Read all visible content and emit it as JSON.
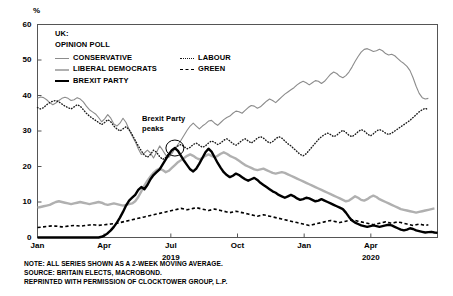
{
  "chart_data": {
    "type": "line",
    "title": "UK: OPINION POLL",
    "title_lines": [
      "UK:",
      "OPINION POLL"
    ],
    "xlabel": "",
    "ylabel": "%",
    "ylim": [
      0,
      60
    ],
    "yticks": [
      0,
      10,
      20,
      30,
      40,
      50,
      60
    ],
    "grid": false,
    "legend_position": "top-left-inside",
    "xticks": [
      {
        "label": "Jan",
        "year": ""
      },
      {
        "label": "Apr",
        "year": ""
      },
      {
        "label": "Jul",
        "year": "2019"
      },
      {
        "label": "Oct",
        "year": ""
      },
      {
        "label": "Jan",
        "year": ""
      },
      {
        "label": "Apr",
        "year": "2020"
      }
    ],
    "x_range": [
      "2019-01",
      "2020-06"
    ],
    "annotations": [
      {
        "text_lines": [
          "Brexit Party",
          "peaks"
        ],
        "x": "2019-05-26",
        "y": 25,
        "marker": "circle"
      }
    ],
    "series": [
      {
        "name": "CONSERVATIVE",
        "color": "#8c8c8c",
        "style": "solid",
        "width": 1.1,
        "values": [
          39.2,
          39.6,
          39.4,
          38.8,
          38.0,
          37.4,
          37.9,
          38.6,
          39.2,
          39.5,
          39.2,
          38.6,
          38.8,
          39.4,
          39.0,
          38.2,
          37.0,
          36.0,
          35.4,
          34.8,
          33.8,
          32.6,
          33.4,
          34.6,
          33.6,
          32.0,
          31.4,
          32.2,
          33.6,
          32.4,
          30.4,
          28.6,
          27.0,
          25.0,
          23.4,
          23.8,
          24.6,
          23.8,
          22.4,
          24.0,
          25.8,
          24.6,
          23.2,
          22.6,
          23.6,
          25.0,
          26.2,
          27.4,
          28.8,
          30.2,
          31.4,
          32.2,
          31.4,
          30.6,
          31.4,
          32.0,
          32.8,
          33.0,
          32.2,
          31.6,
          32.4,
          33.2,
          33.8,
          34.2,
          35.0,
          35.6,
          35.4,
          35.0,
          35.8,
          36.6,
          37.2,
          37.0,
          36.4,
          36.8,
          37.6,
          38.4,
          39.0,
          38.6,
          38.0,
          38.8,
          39.6,
          40.4,
          41.0,
          41.6,
          42.2,
          43.0,
          43.6,
          44.0,
          43.6,
          43.0,
          43.6,
          44.2,
          44.0,
          43.4,
          44.0,
          45.0,
          46.0,
          46.6,
          46.2,
          45.4,
          45.0,
          45.6,
          46.6,
          48.0,
          49.6,
          51.0,
          52.2,
          53.0,
          53.2,
          52.8,
          52.4,
          52.6,
          53.0,
          52.6,
          51.8,
          51.4,
          51.6,
          51.2,
          50.4,
          49.6,
          49.0,
          48.2,
          47.0,
          45.0,
          42.6,
          40.6,
          39.4,
          39.0,
          39.2
        ]
      },
      {
        "name": "LABOUR",
        "color": "#1a1a1a",
        "style": "dotted",
        "width": 1.4,
        "values": [
          36.6,
          36.2,
          36.6,
          37.4,
          38.0,
          38.4,
          38.6,
          38.2,
          37.6,
          37.0,
          36.6,
          36.2,
          36.8,
          37.4,
          37.0,
          36.0,
          35.0,
          34.2,
          33.6,
          33.0,
          32.4,
          31.8,
          32.4,
          33.2,
          32.6,
          31.4,
          30.6,
          30.0,
          30.6,
          31.2,
          30.4,
          29.0,
          27.4,
          25.8,
          24.4,
          23.2,
          22.6,
          23.4,
          24.6,
          24.0,
          22.8,
          22.0,
          22.6,
          23.6,
          24.4,
          25.2,
          25.8,
          26.2,
          25.6,
          25.0,
          25.4,
          26.2,
          26.6,
          26.0,
          25.4,
          25.8,
          26.6,
          27.2,
          26.8,
          26.2,
          26.6,
          27.4,
          27.8,
          27.2,
          26.4,
          26.0,
          26.6,
          27.4,
          27.8,
          27.2,
          26.6,
          27.2,
          28.0,
          28.4,
          28.0,
          27.2,
          26.6,
          27.0,
          27.8,
          28.4,
          28.0,
          27.2,
          26.4,
          25.8,
          25.0,
          24.2,
          23.4,
          23.0,
          23.6,
          24.6,
          25.6,
          26.6,
          27.6,
          28.4,
          29.0,
          29.4,
          29.0,
          28.4,
          28.8,
          29.6,
          30.2,
          29.6,
          28.8,
          28.4,
          29.0,
          29.8,
          30.4,
          30.0,
          29.2,
          28.6,
          29.2,
          30.0,
          30.4,
          30.0,
          29.4,
          29.0,
          29.4,
          30.0,
          30.6,
          31.2,
          31.8,
          32.4,
          33.0,
          33.8,
          34.6,
          35.4,
          36.0,
          36.4,
          36.0
        ]
      },
      {
        "name": "LIBERAL DEMOCRATS",
        "color": "#b0b0b0",
        "style": "solid",
        "width": 2.4,
        "values": [
          8.4,
          8.6,
          8.8,
          9.0,
          9.2,
          9.6,
          10.0,
          10.2,
          10.0,
          9.8,
          9.6,
          9.4,
          9.6,
          9.8,
          10.0,
          9.8,
          9.6,
          9.4,
          9.6,
          9.8,
          10.0,
          9.8,
          9.4,
          9.2,
          9.4,
          9.6,
          9.4,
          9.2,
          9.0,
          9.2,
          9.4,
          9.6,
          10.2,
          11.4,
          13.0,
          14.6,
          16.0,
          17.2,
          18.2,
          19.0,
          19.4,
          19.0,
          18.4,
          18.8,
          19.6,
          20.4,
          21.2,
          21.8,
          22.4,
          23.0,
          23.4,
          23.0,
          22.4,
          22.0,
          22.4,
          23.0,
          23.4,
          23.0,
          22.6,
          23.0,
          23.6,
          24.0,
          23.6,
          23.0,
          22.6,
          22.2,
          21.6,
          21.0,
          20.4,
          20.0,
          19.6,
          19.2,
          19.0,
          19.2,
          19.4,
          19.0,
          18.6,
          18.2,
          18.0,
          18.2,
          18.4,
          18.2,
          17.8,
          17.4,
          17.0,
          16.6,
          16.2,
          15.8,
          15.4,
          15.0,
          14.6,
          14.2,
          13.8,
          13.4,
          13.0,
          12.6,
          12.2,
          11.8,
          11.4,
          11.0,
          10.6,
          10.2,
          10.4,
          11.0,
          11.6,
          11.2,
          10.6,
          10.4,
          10.8,
          11.4,
          11.8,
          11.4,
          10.8,
          10.4,
          10.0,
          9.6,
          9.2,
          8.8,
          8.4,
          8.0,
          7.8,
          7.6,
          7.4,
          7.2,
          7.0,
          7.2,
          7.4,
          7.6,
          7.8,
          8.0,
          8.2
        ]
      },
      {
        "name": "GREEN",
        "color": "#000000",
        "style": "dashed",
        "width": 1.6,
        "values": [
          2.8,
          2.9,
          3.0,
          3.1,
          3.2,
          3.3,
          3.2,
          3.1,
          3.0,
          3.1,
          3.2,
          3.3,
          3.4,
          3.3,
          3.2,
          3.3,
          3.4,
          3.5,
          3.6,
          3.5,
          3.4,
          3.5,
          3.6,
          3.7,
          3.8,
          3.9,
          4.0,
          4.2,
          4.4,
          4.6,
          4.8,
          5.0,
          5.2,
          5.4,
          5.6,
          5.8,
          6.0,
          6.2,
          6.4,
          6.6,
          6.8,
          7.0,
          7.2,
          7.4,
          7.6,
          7.8,
          8.0,
          8.2,
          8.0,
          7.8,
          8.0,
          8.2,
          8.4,
          8.2,
          8.0,
          7.8,
          7.6,
          7.8,
          8.0,
          7.8,
          7.6,
          7.4,
          7.2,
          7.0,
          7.2,
          7.4,
          7.2,
          7.0,
          6.8,
          6.6,
          6.4,
          6.2,
          6.0,
          6.2,
          6.4,
          6.2,
          6.0,
          5.8,
          5.6,
          5.4,
          5.2,
          5.0,
          4.8,
          4.6,
          4.4,
          4.2,
          4.0,
          3.8,
          3.6,
          3.4,
          3.6,
          3.8,
          4.0,
          4.2,
          4.4,
          4.6,
          4.8,
          4.6,
          4.4,
          4.2,
          4.4,
          4.6,
          4.8,
          5.0,
          4.8,
          4.6,
          4.4,
          4.2,
          4.0,
          3.8,
          3.6,
          3.8,
          4.0,
          4.2,
          4.4,
          4.2,
          4.0,
          4.2,
          4.4,
          4.2,
          4.0,
          3.8,
          3.6,
          3.4,
          3.6,
          3.8,
          3.6,
          3.4,
          3.6
        ]
      },
      {
        "name": "BREXIT PARTY",
        "color": "#000000",
        "style": "solid",
        "width": 2.4,
        "values": [
          0.0,
          0.0,
          0.0,
          0.0,
          0.0,
          0.0,
          0.0,
          0.0,
          0.0,
          0.0,
          0.0,
          0.0,
          0.0,
          0.0,
          0.0,
          0.0,
          0.0,
          0.0,
          0.0,
          0.0,
          0.0,
          0.2,
          0.6,
          1.2,
          2.0,
          3.0,
          4.2,
          5.6,
          7.2,
          9.0,
          10.4,
          11.2,
          12.0,
          13.4,
          14.2,
          13.6,
          14.8,
          16.4,
          17.6,
          18.4,
          19.2,
          20.6,
          22.0,
          23.4,
          24.6,
          25.2,
          24.4,
          23.0,
          21.6,
          20.4,
          19.2,
          18.6,
          19.4,
          20.8,
          22.4,
          24.0,
          25.0,
          24.2,
          22.6,
          21.0,
          19.6,
          18.4,
          17.6,
          17.0,
          17.4,
          18.0,
          17.6,
          17.0,
          16.4,
          16.0,
          16.4,
          16.8,
          16.2,
          15.4,
          14.8,
          14.2,
          13.6,
          13.0,
          12.6,
          12.0,
          11.6,
          11.2,
          11.6,
          12.0,
          11.6,
          11.0,
          10.6,
          10.8,
          11.2,
          11.0,
          10.6,
          10.2,
          10.4,
          10.8,
          10.4,
          10.0,
          9.6,
          9.2,
          8.8,
          8.4,
          8.0,
          7.0,
          5.8,
          4.8,
          4.2,
          3.8,
          3.4,
          3.2,
          3.0,
          3.2,
          3.4,
          3.2,
          3.0,
          3.2,
          3.4,
          3.6,
          3.4,
          3.0,
          2.6,
          2.2,
          2.0,
          2.2,
          2.6,
          2.4,
          2.0,
          1.8,
          1.6,
          1.4,
          1.5,
          1.6,
          1.4,
          1.3
        ]
      }
    ]
  },
  "axes": {
    "y_unit": "%",
    "y_tick_labels": [
      "0",
      "10",
      "20",
      "30",
      "40",
      "50",
      "60"
    ],
    "x_tick_labels": [
      "Jan",
      "Apr",
      "Jul",
      "Oct",
      "Jan",
      "Apr"
    ],
    "x_year_labels": [
      "",
      "",
      "2019",
      "",
      "",
      "2020"
    ]
  },
  "legend": {
    "header_line1": "UK:",
    "header_line2": "OPINION POLL",
    "items": [
      {
        "label": "CONSERVATIVE",
        "style": "solid-thin-gray"
      },
      {
        "label": "LABOUR",
        "style": "dotted-black"
      },
      {
        "label": "LIBERAL DEMOCRATS",
        "style": "solid-thick-lightgray"
      },
      {
        "label": "GREEN",
        "style": "dashed-black"
      },
      {
        "label": "BREXIT PARTY",
        "style": "solid-thick-black"
      }
    ]
  },
  "annotation": {
    "line1": "Brexit Party",
    "line2": "peaks"
  },
  "footnote": {
    "line1": "NOTE: ALL SERIES SHOWN AS A 2-WEEK MOVING AVERAGE.",
    "line2": "SOURCE: BRITAIN ELECTS, MACROBOND.",
    "line3": "REPRINTED WITH PERMISSION OF CLOCKTOWER GROUP, L.P."
  },
  "colors": {
    "conservative": "#8c8c8c",
    "labour": "#1a1a1a",
    "libdem": "#b0b0b0",
    "green": "#000000",
    "brexit": "#000000",
    "axis": "#555555"
  }
}
